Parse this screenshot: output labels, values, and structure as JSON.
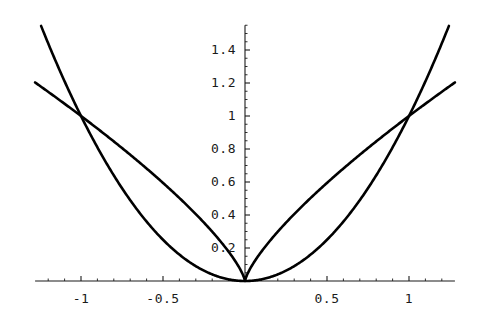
{
  "chart_data": {
    "type": "line",
    "title": "",
    "subtitle": "",
    "xlabel": "",
    "ylabel": "",
    "xlim": [
      -1.28,
      1.28
    ],
    "ylim": [
      -0.06,
      1.55
    ],
    "grid": false,
    "legend": null,
    "legend_position": "none",
    "axis_style": "centered-origin-axes",
    "line_color": "#000000",
    "axis_color": "#1a1a1a",
    "xticks": [
      -1,
      -0.5,
      0.5,
      1
    ],
    "xtick_labels": [
      "-1",
      "-0.5",
      "0.5",
      "1"
    ],
    "yticks": [
      0.2,
      0.4,
      0.6,
      0.8,
      1,
      1.2,
      1.4
    ],
    "ytick_labels": [
      "0.2",
      "0.4",
      "0.6",
      "0.8",
      "1",
      "1.2",
      "1.4"
    ],
    "x_minor_tick_step": 0.1,
    "y_minor_tick_step": 0.05,
    "annotations": [
      {
        "text": "curves intersect at (-1, 1)",
        "x": -1,
        "y": 1
      },
      {
        "text": "curves intersect at (0, 0)",
        "x": 0,
        "y": 0
      },
      {
        "text": "curves intersect at (1, 1)",
        "x": 1,
        "y": 1
      }
    ],
    "series": [
      {
        "name": "parabola",
        "expression": "y = x^2",
        "color": "#000000",
        "x": [
          -1.28,
          -1.2,
          -1.1,
          -1.0,
          -0.9,
          -0.8,
          -0.7,
          -0.6,
          -0.5,
          -0.4,
          -0.3,
          -0.2,
          -0.1,
          0.0,
          0.1,
          0.2,
          0.3,
          0.4,
          0.5,
          0.6,
          0.7,
          0.8,
          0.9,
          1.0,
          1.1,
          1.2,
          1.28
        ],
        "values": [
          1.638,
          1.44,
          1.21,
          1.0,
          0.81,
          0.64,
          0.49,
          0.36,
          0.25,
          0.16,
          0.09,
          0.04,
          0.01,
          0.0,
          0.01,
          0.04,
          0.09,
          0.16,
          0.25,
          0.36,
          0.49,
          0.64,
          0.81,
          1.0,
          1.21,
          1.44,
          1.638
        ]
      },
      {
        "name": "root-power curve",
        "expression": "y = |x|^(3/4)",
        "color": "#000000",
        "x": [
          -1.28,
          -1.2,
          -1.1,
          -1.0,
          -0.9,
          -0.8,
          -0.7,
          -0.6,
          -0.5,
          -0.4,
          -0.3,
          -0.2,
          -0.1,
          0.0,
          0.1,
          0.2,
          0.3,
          0.4,
          0.5,
          0.6,
          0.7,
          0.8,
          0.9,
          1.0,
          1.1,
          1.2,
          1.28
        ],
        "values": [
          1.203,
          1.147,
          1.074,
          1.0,
          0.924,
          0.846,
          0.765,
          0.682,
          0.595,
          0.503,
          0.405,
          0.299,
          0.178,
          0.0,
          0.178,
          0.299,
          0.405,
          0.503,
          0.595,
          0.682,
          0.765,
          0.846,
          0.924,
          1.0,
          1.074,
          1.147,
          1.203
        ]
      }
    ]
  }
}
